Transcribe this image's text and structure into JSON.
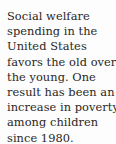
{
  "document": {
    "type": "scanned-text-excerpt",
    "background_color": "#fdfdfd",
    "text_color": "#2a2724",
    "full_text": "Social welfare spending in the United States favors the old over the young. One result has been an increase in poverty among children since 1980.",
    "lines": [
      "Social welfare",
      "spending in the",
      "United States",
      "favors the old over",
      "the young. One",
      "result has been an",
      "increase in poverty",
      "among children",
      "since 1980."
    ]
  }
}
